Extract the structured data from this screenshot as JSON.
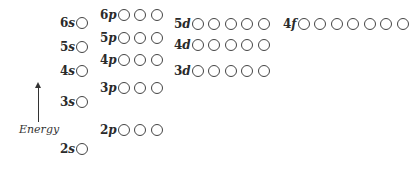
{
  "diagram": {
    "axis": {
      "label": "Energy",
      "direction": "up"
    },
    "orbitals": [
      {
        "id": "6s",
        "n": "6",
        "l": "s",
        "circles": 1,
        "x": 60,
        "y": 16
      },
      {
        "id": "5s",
        "n": "5",
        "l": "s",
        "circles": 1,
        "x": 60,
        "y": 40
      },
      {
        "id": "4s",
        "n": "4",
        "l": "s",
        "circles": 1,
        "x": 60,
        "y": 64
      },
      {
        "id": "3s",
        "n": "3",
        "l": "s",
        "circles": 1,
        "x": 60,
        "y": 95
      },
      {
        "id": "2s",
        "n": "2",
        "l": "s",
        "circles": 1,
        "x": 60,
        "y": 142
      },
      {
        "id": "6p",
        "n": "6",
        "l": "p",
        "circles": 3,
        "x": 100,
        "y": 8
      },
      {
        "id": "5p",
        "n": "5",
        "l": "p",
        "circles": 3,
        "x": 100,
        "y": 31
      },
      {
        "id": "4p",
        "n": "4",
        "l": "p",
        "circles": 3,
        "x": 100,
        "y": 53
      },
      {
        "id": "3p",
        "n": "3",
        "l": "p",
        "circles": 3,
        "x": 100,
        "y": 81
      },
      {
        "id": "2p",
        "n": "2",
        "l": "p",
        "circles": 3,
        "x": 100,
        "y": 123
      },
      {
        "id": "5d",
        "n": "5",
        "l": "d",
        "circles": 5,
        "x": 174,
        "y": 17
      },
      {
        "id": "4d",
        "n": "4",
        "l": "d",
        "circles": 5,
        "x": 174,
        "y": 38
      },
      {
        "id": "3d",
        "n": "3",
        "l": "d",
        "circles": 5,
        "x": 174,
        "y": 64
      },
      {
        "id": "4f",
        "n": "4",
        "l": "f",
        "circles": 7,
        "x": 283,
        "y": 17
      }
    ]
  }
}
